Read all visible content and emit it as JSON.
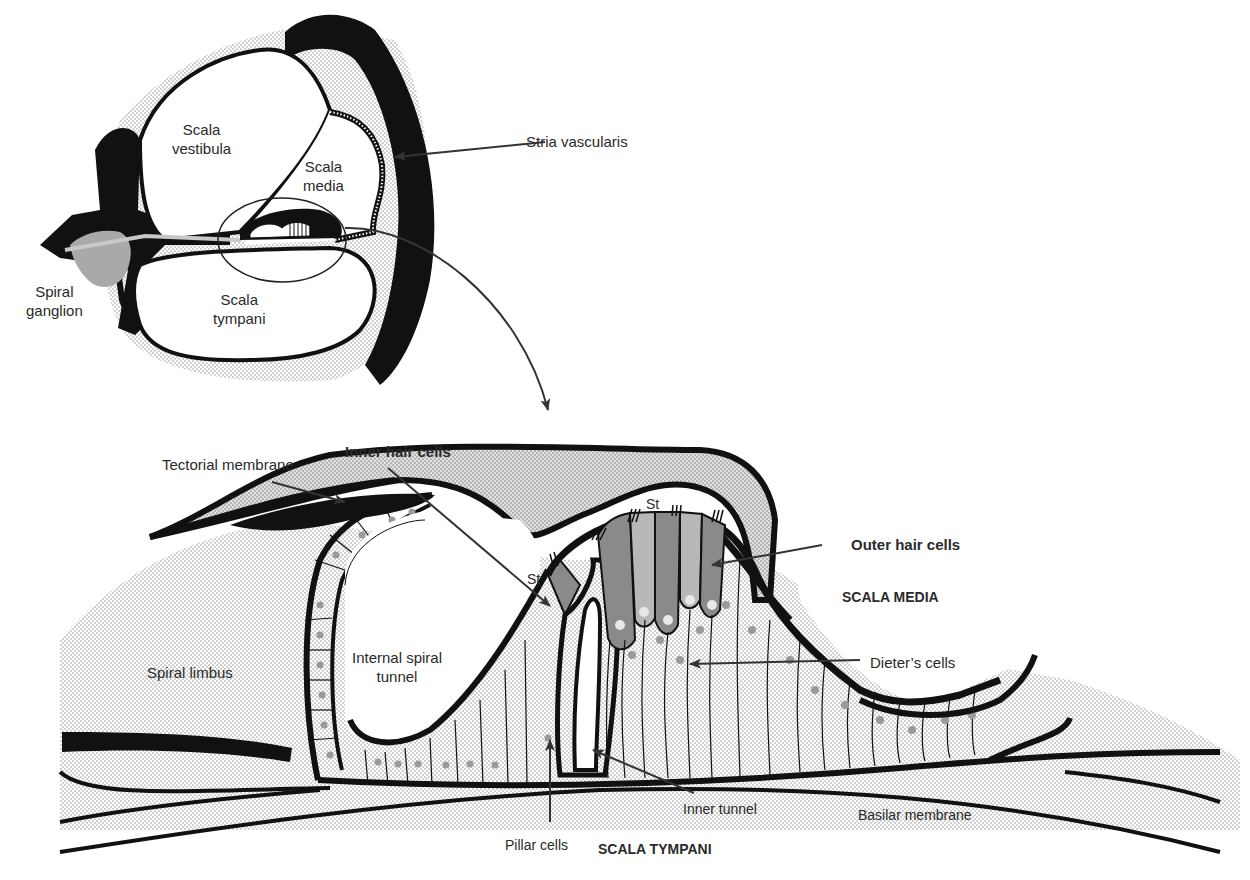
{
  "figure": {
    "colors": {
      "ink": "#111111",
      "label_text": "#2a2a2a",
      "stipple": "#d4d4d4",
      "hair_cell_dark": "#8a8a8a",
      "hair_cell_light": "#b8b8b8",
      "nucleus": "#9a9a9a",
      "background": "#ffffff"
    }
  },
  "overview": {
    "scala_vestibula": [
      "Scala",
      "vestibula"
    ],
    "scala_media": [
      "Scala",
      "media"
    ],
    "scala_tympani": [
      "Scala",
      "tympani"
    ],
    "spiral_ganglion": [
      "Spiral",
      "ganglion"
    ],
    "stria_vascularis": "Stria vascularis"
  },
  "detail": {
    "tectorial_membrane": "Tectorial membrane",
    "inner_hair_cells": "Inner hair cells",
    "outer_hair_cells": "Outer hair cells",
    "scala_media": "SCALA MEDIA",
    "dieters_cells": "Dieter’s cells",
    "spiral_limbus": "Spiral limbus",
    "internal_spiral_tunnel": [
      "Internal spiral",
      "tunnel"
    ],
    "stereocilia_abbrev_1": "St",
    "stereocilia_abbrev_2": "St",
    "inner_tunnel": "Inner tunnel",
    "basilar_membrane": "Basilar membrane",
    "pillar_cells": "Pillar cells",
    "scala_tympani": "SCALA TYMPANI"
  }
}
